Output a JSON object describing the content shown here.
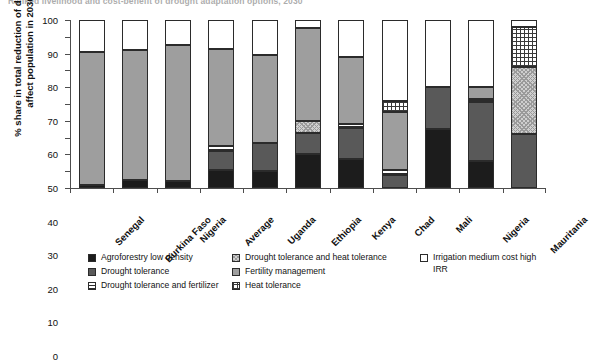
{
  "title": "Ranked livelihood and cost-benefit of drought adaptation options, 2030",
  "chart_data": {
    "type": "bar",
    "stacked": true,
    "title": "Ranked livelihood and cost-benefit of drought adaptation options, 2030",
    "xlabel": "",
    "ylabel": "% share in total reduction of drought-affect population in 2030",
    "ylim": [
      0,
      100
    ],
    "yticks": [
      0,
      10,
      20,
      30,
      40,
      50,
      60,
      70,
      80,
      90,
      100
    ],
    "grid": false,
    "legend_position": "bottom",
    "categories": [
      "Senegal",
      "Burkina Faso",
      "Nigeria",
      "Average",
      "Uganda",
      "Ethiopia",
      "Kenya",
      "Chad",
      "Mali",
      "Nigeria",
      "Mauritania"
    ],
    "series": [
      {
        "name": "Agroforestry low density",
        "key": "agro",
        "fill": "solid-black",
        "color": "#1c1c1c",
        "values": [
          2,
          5,
          4,
          11,
          10,
          20,
          17,
          0,
          35,
          16,
          0
        ]
      },
      {
        "name": "Drought tolerance",
        "key": "dt",
        "fill": "solid-dark-gray",
        "color": "#595959",
        "values": [
          0,
          0,
          0,
          11,
          17,
          13,
          19,
          8,
          25,
          35,
          32
        ]
      },
      {
        "name": "Drought tolerance and fertilizer",
        "key": "dtfert",
        "fill": "horizontal-lines",
        "color": "#ffffff",
        "values": [
          0,
          0,
          0,
          3,
          0,
          0,
          2,
          3,
          0,
          2,
          0
        ]
      },
      {
        "name": "Drought tolerance and heat tolerance",
        "key": "dtht",
        "fill": "cross-hatch",
        "color": "#cfcfcf",
        "values": [
          0,
          0,
          0,
          0,
          0,
          7,
          0,
          0,
          0,
          0,
          40
        ]
      },
      {
        "name": "Fertility management",
        "key": "fert",
        "fill": "solid-light-gray",
        "color": "#9e9e9e",
        "values": [
          79,
          77,
          81,
          58,
          52,
          55,
          40,
          34,
          0,
          7,
          0
        ]
      },
      {
        "name": "Heat tolerance",
        "key": "heat",
        "fill": "grid",
        "color": "#ffffff",
        "values": [
          0,
          0,
          0,
          0,
          0,
          0,
          0,
          7,
          0,
          0,
          24
        ]
      },
      {
        "name": "Irrigation medium cost high IRR",
        "key": "irr",
        "fill": "solid-white",
        "color": "#ffffff",
        "values": [
          19,
          18,
          15,
          17,
          21,
          5,
          22,
          48,
          40,
          40,
          4
        ]
      }
    ]
  },
  "legend": {
    "columns": [
      [
        {
          "label": "Agroforestry low density",
          "key": "agro"
        },
        {
          "label": "Drought tolerance",
          "key": "dt"
        },
        {
          "label": "Drought tolerance and fertilizer",
          "key": "dtfert"
        }
      ],
      [
        {
          "label": "Drought tolerance and heat tolerance",
          "key": "dtht"
        },
        {
          "label": "Fertility management",
          "key": "fert"
        },
        {
          "label": "Heat tolerance",
          "key": "heat"
        }
      ],
      [
        {
          "label": "Irrigation medium cost high IRR",
          "key": "irr"
        }
      ]
    ]
  }
}
